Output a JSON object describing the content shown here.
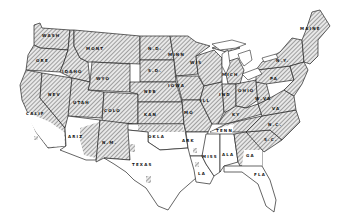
{
  "map": {
    "type": "choropleth",
    "subject": "United States (contiguous) — shaded vs unshaded regions",
    "legend_colors": {
      "shaded": "hatched",
      "unshaded": "#ffffff",
      "border": "#222222"
    },
    "states": [
      {
        "id": "wash",
        "label": "WASH",
        "shaded": true
      },
      {
        "id": "ore",
        "label": "ORE",
        "shaded": true
      },
      {
        "id": "calif",
        "label": "CALIF",
        "shaded": "partial"
      },
      {
        "id": "idaho",
        "label": "IDAHO",
        "shaded": true
      },
      {
        "id": "nev",
        "label": "NEV",
        "shaded": true
      },
      {
        "id": "mont",
        "label": "MONT",
        "shaded": true
      },
      {
        "id": "wyo",
        "label": "WYO",
        "shaded": true
      },
      {
        "id": "utah",
        "label": "UTAH",
        "shaded": true
      },
      {
        "id": "colo",
        "label": "COLO",
        "shaded": true
      },
      {
        "id": "ariz",
        "label": "ARIZ",
        "shaded": "partial"
      },
      {
        "id": "nm",
        "label": "N.M.",
        "shaded": "partial"
      },
      {
        "id": "nd",
        "label": "N.D.",
        "shaded": true
      },
      {
        "id": "sd",
        "label": "S.D.",
        "shaded": true
      },
      {
        "id": "neb",
        "label": "NEB",
        "shaded": true
      },
      {
        "id": "kan",
        "label": "KAN",
        "shaded": true
      },
      {
        "id": "okla",
        "label": "OKLA",
        "shaded": "partial"
      },
      {
        "id": "texas",
        "label": "TEXAS",
        "shaded": "partial"
      },
      {
        "id": "minn",
        "label": "MINN",
        "shaded": true
      },
      {
        "id": "iowa",
        "label": "IOWA",
        "shaded": true
      },
      {
        "id": "mo",
        "label": "MO",
        "shaded": true
      },
      {
        "id": "ark",
        "label": "ARK",
        "shaded": "partial"
      },
      {
        "id": "la",
        "label": "LA",
        "shaded": "partial"
      },
      {
        "id": "wis",
        "label": "WIS",
        "shaded": true
      },
      {
        "id": "ill",
        "label": "ILL",
        "shaded": true
      },
      {
        "id": "mich",
        "label": "MICH",
        "shaded": true
      },
      {
        "id": "ind",
        "label": "IND",
        "shaded": true
      },
      {
        "id": "ohio",
        "label": "OHIO",
        "shaded": true
      },
      {
        "id": "ky",
        "label": "KY",
        "shaded": true
      },
      {
        "id": "tenn",
        "label": "TENN",
        "shaded": "partial"
      },
      {
        "id": "miss",
        "label": "MISS",
        "shaded": false
      },
      {
        "id": "ala",
        "label": "ALA",
        "shaded": "partial"
      },
      {
        "id": "ga",
        "label": "GA",
        "shaded": "partial"
      },
      {
        "id": "fla",
        "label": "FLA",
        "shaded": false
      },
      {
        "id": "sc",
        "label": "S.C.",
        "shaded": true
      },
      {
        "id": "nc",
        "label": "N.C.",
        "shaded": true
      },
      {
        "id": "va",
        "label": "VA",
        "shaded": true
      },
      {
        "id": "wva",
        "label": "W.VA",
        "shaded": true
      },
      {
        "id": "pa",
        "label": "PA",
        "shaded": true
      },
      {
        "id": "ny",
        "label": "N.Y.",
        "shaded": true
      },
      {
        "id": "maine",
        "label": "MAINE",
        "shaded": true
      }
    ]
  }
}
